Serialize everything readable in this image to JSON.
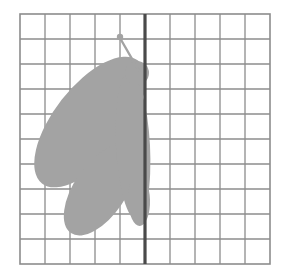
{
  "page": {
    "background_color": "#ffffff",
    "width": 286,
    "height": 274
  },
  "grid": {
    "name": "square-grid",
    "origin_x": 20,
    "origin_y": 14,
    "columns": 10,
    "rows": 10,
    "cell_size": 25,
    "width": 250,
    "height": 250,
    "line_color": "#8c8c8c",
    "line_width": 1.3,
    "border_color": "#8c8c8c",
    "border_width": 1.6,
    "grid_on": true
  },
  "symmetry_line": {
    "name": "line-of-symmetry",
    "orientation": "vertical",
    "column_index": 5,
    "x": 145,
    "y_start": 14,
    "y_end": 264,
    "color": "#4a4a4a",
    "line_width": 3.2
  },
  "figure": {
    "name": "half-butterfly",
    "fill_color": "#a3a3a3",
    "stroke_color": "#a3a3a3",
    "parts": [
      {
        "name": "upper-wing",
        "type": "rotated-ellipse",
        "center_x": 90,
        "center_y": 122,
        "radius_x": 78,
        "radius_y": 36,
        "rotation_deg": -52
      },
      {
        "name": "lower-wing",
        "type": "rotated-ellipse",
        "center_x": 100,
        "center_y": 190,
        "radius_x": 52,
        "radius_y": 26,
        "rotation_deg": -56
      },
      {
        "name": "body",
        "type": "rotated-ellipse",
        "center_x": 133,
        "center_y": 146,
        "radius_x": 17,
        "radius_y": 74,
        "rotation_deg": -3
      },
      {
        "name": "lower-body-tip",
        "type": "rotated-ellipse",
        "center_x": 139,
        "center_y": 200,
        "radius_x": 11,
        "radius_y": 26,
        "rotation_deg": -2
      },
      {
        "name": "head",
        "type": "circle",
        "center_x": 137,
        "center_y": 73,
        "radius": 12
      },
      {
        "name": "antenna-stalk",
        "type": "line",
        "x1": 120,
        "y1": 38,
        "x2": 139,
        "y2": 71,
        "line_width": 2.4
      },
      {
        "name": "antenna-tip",
        "type": "circle",
        "center_x": 120,
        "center_y": 37,
        "radius": 3.2
      }
    ]
  }
}
